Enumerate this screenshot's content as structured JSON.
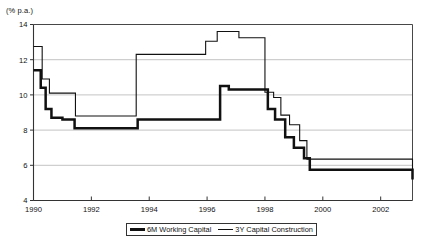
{
  "chart_data": {
    "type": "line",
    "title": "",
    "subtitle": "",
    "xlabel": "",
    "ylabel": "(% p.a.)",
    "ylim": [
      4,
      14
    ],
    "xlim": [
      1990,
      2003.1
    ],
    "grid": true,
    "gridlines_y": [
      6,
      8,
      10,
      12,
      14
    ],
    "yticks": [
      4,
      6,
      8,
      10,
      12,
      14
    ],
    "ytick_labels": [
      "4",
      "6",
      "8",
      "10",
      "12",
      "14"
    ],
    "xticks": [
      1990,
      1992,
      1994,
      1996,
      1998,
      2000,
      2002
    ],
    "xtick_labels": [
      "1990",
      "1992",
      "1994",
      "1996",
      "1998",
      "2000",
      "2002"
    ],
    "legend_position": "bottom-center",
    "line_style": "step-post",
    "series": [
      {
        "name": "6M Working Capital",
        "color": "#111111",
        "line_width": 2.5,
        "x": [
          1990.0,
          1990.12,
          1990.25,
          1990.42,
          1990.62,
          1991.0,
          1991.42,
          1993.35,
          1993.6,
          1996.1,
          1996.45,
          1996.75,
          1997.8,
          1998.1,
          1998.35,
          1998.7,
          1999.0,
          1999.35,
          1999.55,
          2002.15,
          2003.1
        ],
        "y": [
          11.4,
          11.4,
          10.4,
          9.2,
          8.7,
          8.6,
          8.1,
          8.1,
          8.6,
          8.6,
          10.5,
          10.3,
          10.3,
          9.2,
          8.6,
          7.6,
          7.0,
          6.4,
          5.75,
          5.75,
          5.2
        ]
      },
      {
        "name": "3Y Capital Construction",
        "color": "#111111",
        "line_width": 1.1,
        "x": [
          1990.0,
          1990.12,
          1990.3,
          1990.55,
          1991.0,
          1991.45,
          1993.3,
          1993.55,
          1995.6,
          1995.95,
          1996.35,
          1996.8,
          1997.1,
          1997.75,
          1998.0,
          1998.3,
          1998.55,
          1998.85,
          1999.2,
          1999.45,
          2002.15,
          2003.1
        ],
        "y": [
          12.75,
          12.75,
          10.9,
          10.1,
          10.1,
          8.8,
          8.8,
          12.3,
          12.3,
          13.05,
          13.6,
          13.6,
          13.25,
          13.25,
          10.15,
          9.85,
          8.85,
          8.3,
          7.4,
          6.35,
          6.35,
          5.65
        ]
      }
    ]
  },
  "legend": {
    "items": [
      {
        "label": "6M Working Capital",
        "swatch": "thick-line-swatch"
      },
      {
        "label": "3Y Capital Construction",
        "swatch": "thin-line-swatch"
      }
    ]
  }
}
